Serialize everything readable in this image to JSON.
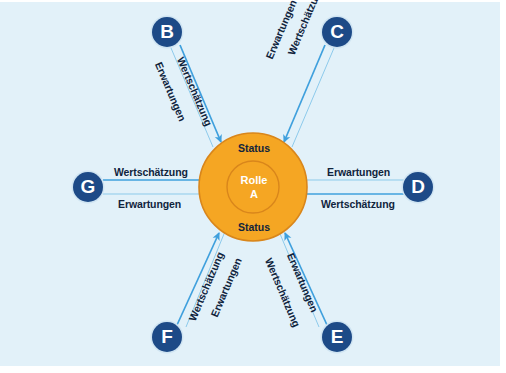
{
  "diagram": {
    "background_color": "#e2f1f9",
    "node_color": "#1d4a87",
    "core_color": "#f5a623",
    "core_ring_color": "#d9861b",
    "arrow_color": "#3fa0dd",
    "label_color": "#10243d",
    "center": {
      "status_top": "Status",
      "status_bottom": "Status",
      "role_line1": "Rolle",
      "role_line2": "A"
    },
    "nodes": [
      {
        "id": "B",
        "label": "B",
        "position": "top-left"
      },
      {
        "id": "C",
        "label": "C",
        "position": "top-right"
      },
      {
        "id": "D",
        "label": "D",
        "position": "right"
      },
      {
        "id": "E",
        "label": "E",
        "position": "bottom-right"
      },
      {
        "id": "F",
        "label": "F",
        "position": "bottom-left"
      },
      {
        "id": "G",
        "label": "G",
        "position": "left"
      }
    ],
    "edge_labels": {
      "wertschaetzung": "Wertschätzung",
      "erwartungen": "Erwartungen"
    },
    "edges": [
      {
        "node": "B",
        "inbound_label": "Wertschätzung",
        "outbound_label": "Erwartungen"
      },
      {
        "node": "C",
        "inbound_label": "Wertschätzung",
        "outbound_label": "Erwartungen"
      },
      {
        "node": "D",
        "inbound_label": "Wertschätzung",
        "outbound_label": "Erwartungen"
      },
      {
        "node": "E",
        "inbound_label": "Wertschätzung",
        "outbound_label": "Erwartungen"
      },
      {
        "node": "F",
        "inbound_label": "Wertschätzung",
        "outbound_label": "Erwartungen"
      },
      {
        "node": "G",
        "inbound_label": "Wertschätzung",
        "outbound_label": "Erwartungen"
      }
    ]
  }
}
